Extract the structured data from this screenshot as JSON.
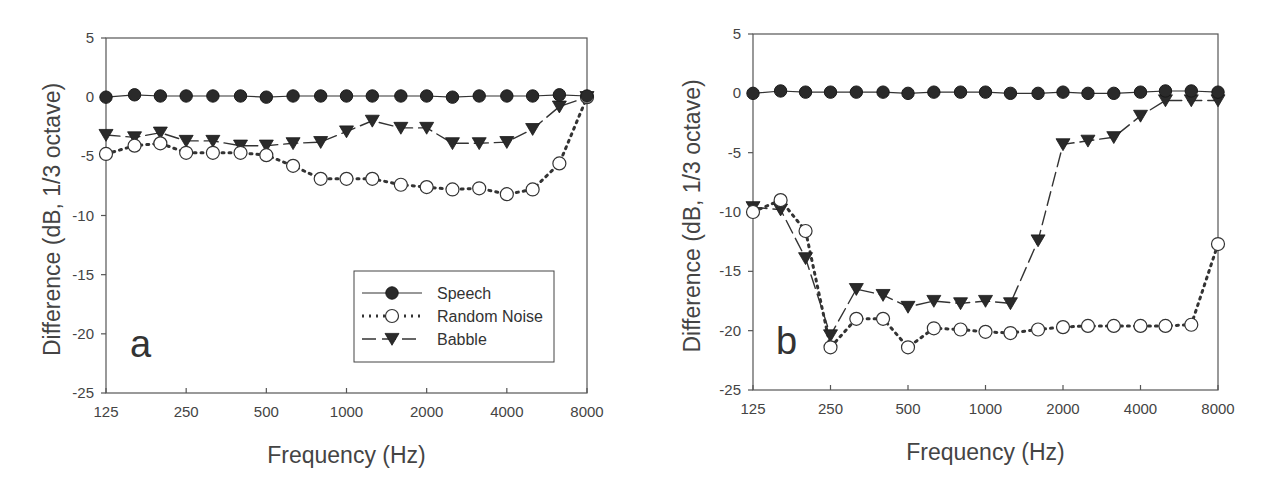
{
  "chart_data": [
    {
      "panel": "a",
      "type": "line",
      "title": "",
      "xlabel": "Frequency (Hz)",
      "ylabel": "Difference (dB, 1/3 octave)",
      "x_scale": "log2",
      "x_ticks": [
        125,
        250,
        500,
        1000,
        2000,
        4000,
        8000
      ],
      "y_ticks": [
        5,
        0,
        -5,
        -10,
        -15,
        -20,
        -25
      ],
      "ylim": [
        -25,
        5
      ],
      "grid": false,
      "legend_position": "lower right",
      "x": [
        125,
        160,
        200,
        250,
        315,
        400,
        500,
        630,
        800,
        1000,
        1250,
        1600,
        2000,
        2500,
        3150,
        4000,
        5000,
        6300,
        8000
      ],
      "series": [
        {
          "name": "Speech",
          "marker": "filled-circle",
          "line": "solid",
          "values": [
            0,
            0.2,
            0.1,
            0.1,
            0.1,
            0.1,
            0,
            0.1,
            0.1,
            0.1,
            0.1,
            0.1,
            0.1,
            0,
            0.1,
            0.1,
            0.1,
            0.2,
            0.1
          ]
        },
        {
          "name": "Random Noise",
          "marker": "open-circle",
          "line": "dotted",
          "values": [
            -4.8,
            -4.1,
            -3.9,
            -4.7,
            -4.7,
            -4.7,
            -4.9,
            -5.8,
            -6.9,
            -6.9,
            -6.9,
            -7.4,
            -7.6,
            -7.8,
            -7.7,
            -8.2,
            -7.8,
            -5.6,
            0
          ]
        },
        {
          "name": "Babble",
          "marker": "filled-triangle-down",
          "line": "dashed",
          "values": [
            -3.2,
            -3.4,
            -3.0,
            -3.7,
            -3.7,
            -4.1,
            -4.1,
            -3.9,
            -3.8,
            -2.9,
            -2.0,
            -2.6,
            -2.6,
            -3.9,
            -3.9,
            -3.8,
            -2.7,
            -0.8,
            0
          ]
        }
      ]
    },
    {
      "panel": "b",
      "type": "line",
      "title": "",
      "xlabel": "Frequency (Hz)",
      "ylabel": "Difference (dB, 1/3 octave)",
      "x_scale": "log2",
      "x_ticks": [
        125,
        250,
        500,
        1000,
        2000,
        4000,
        8000
      ],
      "y_ticks": [
        5,
        0,
        -5,
        -10,
        -15,
        -20,
        -25
      ],
      "ylim": [
        -25,
        5
      ],
      "grid": false,
      "x": [
        125,
        160,
        200,
        250,
        315,
        400,
        500,
        630,
        800,
        1000,
        1250,
        1600,
        2000,
        2500,
        3150,
        4000,
        5000,
        6300,
        8000
      ],
      "series": [
        {
          "name": "Speech",
          "marker": "filled-circle",
          "line": "solid",
          "values": [
            0,
            0.2,
            0.1,
            0.1,
            0.1,
            0.1,
            0,
            0.1,
            0.1,
            0.1,
            0,
            0,
            0.1,
            0,
            0,
            0.1,
            0.2,
            0.2,
            0.1
          ]
        },
        {
          "name": "Random Noise",
          "marker": "open-circle",
          "line": "dotted",
          "values": [
            -10.0,
            -9.0,
            -11.6,
            -21.4,
            -19.0,
            -19.0,
            -21.4,
            -19.8,
            -19.9,
            -20.1,
            -20.2,
            -19.9,
            -19.7,
            -19.6,
            -19.6,
            -19.6,
            -19.6,
            -19.5,
            -12.7
          ]
        },
        {
          "name": "Babble",
          "marker": "filled-triangle-down",
          "line": "dashed",
          "values": [
            -9.6,
            -9.8,
            -13.9,
            -20.4,
            -16.5,
            -17.0,
            -18.0,
            -17.5,
            -17.7,
            -17.5,
            -17.7,
            -12.4,
            -4.3,
            -4.0,
            -3.7,
            -1.9,
            -0.6,
            -0.6,
            -0.6
          ]
        }
      ]
    }
  ],
  "panels": [
    {
      "letter": "a",
      "xlabel": "Frequency (Hz)",
      "ylabel": "Difference (dB, 1/3 octave)",
      "x_tick_labels": [
        "125",
        "250",
        "500",
        "1000",
        "2000",
        "4000",
        "8000"
      ],
      "y_tick_labels": [
        "5",
        "0",
        "-5",
        "-10",
        "-15",
        "-20",
        "-25"
      ]
    },
    {
      "letter": "b",
      "xlabel": "Frequency (Hz)",
      "ylabel": "Difference (dB, 1/3 octave)",
      "x_tick_labels": [
        "125",
        "250",
        "500",
        "1000",
        "2000",
        "4000",
        "8000"
      ],
      "y_tick_labels": [
        "5",
        "0",
        "-5",
        "-10",
        "-15",
        "-20",
        "-25"
      ]
    }
  ],
  "legend": {
    "items": [
      {
        "label": "Speech",
        "marker": "filled-circle",
        "line": "solid"
      },
      {
        "label": "Random Noise",
        "marker": "open-circle",
        "line": "dotted"
      },
      {
        "label": "Babble",
        "marker": "filled-triangle-down",
        "line": "dashed"
      }
    ]
  },
  "colors": {
    "axis": "#555555",
    "marker_fill": "#2a2a2a",
    "text": "#444444",
    "background": "#ffffff"
  }
}
